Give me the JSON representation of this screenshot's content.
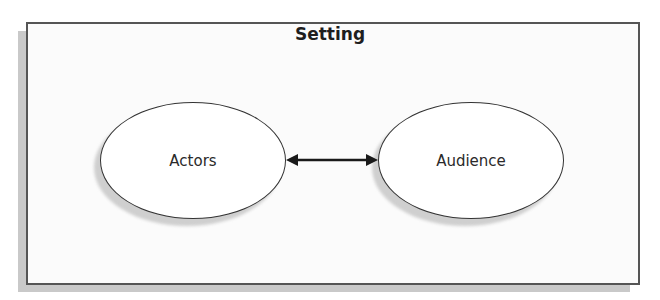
{
  "diagram": {
    "container": {
      "title": "Setting"
    },
    "nodes": [
      {
        "id": "actors",
        "label": "Actors"
      },
      {
        "id": "audience",
        "label": "Audience"
      }
    ],
    "edges": [
      {
        "from": "actors",
        "to": "audience",
        "type": "bidirectional-arrow"
      }
    ],
    "colors": {
      "border": "#555555",
      "shadow": "#c9c9c9",
      "arrow": "#1a1a1a"
    }
  }
}
